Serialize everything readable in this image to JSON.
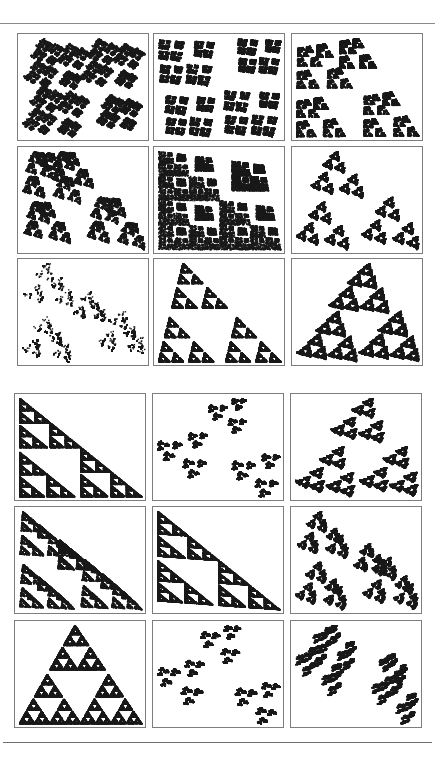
{
  "page": {
    "background": "#ffffff",
    "ink_color": "#1a1a1a",
    "frame_color": "#7d7d7d",
    "rule_color": "#8a8a8a"
  },
  "figure_blocks": [
    {
      "name": "block-top",
      "columns_x": [
        17,
        153,
        291
      ],
      "rows_y": [
        33,
        146,
        258
      ],
      "panel_w": 132,
      "panel_h": 108,
      "panels": [
        {
          "style": "tri-cross",
          "maps": [
            [
              0.5,
              0,
              0,
              0.5,
              0,
              0
            ],
            [
              0.5,
              0,
              0,
              0.5,
              0.5,
              0
            ],
            [
              0.5,
              0,
              0,
              0.5,
              0,
              0.5
            ],
            [
              0.35,
              0,
              0,
              0.35,
              0.6,
              0.6
            ]
          ],
          "rot": 0.35
        },
        {
          "style": "plus-branch",
          "maps": [
            [
              0.45,
              0,
              0,
              0.45,
              0,
              0.05
            ],
            [
              0.45,
              0,
              0,
              0.45,
              0.5,
              0.5
            ],
            [
              0.4,
              0,
              0,
              0.4,
              0.05,
              0.55
            ],
            [
              0.35,
              0,
              0,
              0.35,
              0.6,
              0.05
            ]
          ],
          "rot": 0.1
        },
        {
          "style": "square-loop",
          "maps": [
            [
              0.45,
              0,
              0,
              0.45,
              0.05,
              0.05
            ],
            [
              0.45,
              0,
              0,
              0.45,
              0.5,
              0.5
            ],
            [
              0.4,
              0,
              0,
              0.4,
              0.05,
              0.55
            ],
            [
              0.3,
              0,
              0,
              0.3,
              0.35,
              0.0
            ]
          ],
          "rot": 0.0
        },
        {
          "style": "tri-cross",
          "maps": [
            [
              0.5,
              0,
              0,
              0.5,
              0,
              0
            ],
            [
              0.5,
              0,
              0,
              0.5,
              0.5,
              0.5
            ],
            [
              0.4,
              0,
              0,
              0.4,
              0,
              0.55
            ],
            [
              0.35,
              0,
              0,
              0.35,
              0.2,
              0.0
            ]
          ],
          "rot": 0.2
        },
        {
          "style": "plus-lattice",
          "maps": [
            [
              0.5,
              0,
              0,
              0.5,
              0,
              0
            ],
            [
              0.5,
              0,
              0,
              0.5,
              0.5,
              0.5
            ],
            [
              0.5,
              0,
              0,
              0.5,
              0,
              0.5
            ],
            [
              0.3,
              0,
              0,
              0.3,
              0.6,
              0.1
            ]
          ],
          "rot": 0.0
        },
        {
          "style": "star-cluster",
          "maps": [
            [
              0.45,
              0,
              0,
              0.45,
              0.1,
              0
            ],
            [
              0.5,
              0,
              0,
              0.5,
              0.5,
              0.45
            ],
            [
              0.45,
              0,
              0,
              0.45,
              0,
              0.5
            ]
          ],
          "rot": 0.3
        },
        {
          "style": "hex-ring",
          "maps": [
            [
              0.45,
              0,
              0,
              0.45,
              0,
              0
            ],
            [
              0.45,
              0,
              0,
              0.45,
              0.55,
              0.5
            ],
            [
              0.45,
              0,
              0,
              0.45,
              0,
              0.55
            ],
            [
              0.3,
              0,
              0,
              0.3,
              0.3,
              0.3
            ]
          ],
          "rot": 0.5
        },
        {
          "style": "plus-branch",
          "maps": [
            [
              0.45,
              0,
              0,
              0.45,
              0.1,
              0.0
            ],
            [
              0.45,
              0,
              0,
              0.45,
              0.5,
              0.5
            ],
            [
              0.45,
              0,
              0,
              0.45,
              0.0,
              0.5
            ]
          ],
          "rot": 0.0
        },
        {
          "style": "triangle-gasket",
          "maps": [
            [
              0.5,
              0,
              0,
              0.5,
              0.25,
              0
            ],
            [
              0.5,
              0,
              0,
              0.5,
              0,
              0.5
            ],
            [
              0.5,
              0,
              0,
              0.5,
              0.5,
              0.5
            ]
          ],
          "rot": 0.15
        }
      ]
    },
    {
      "name": "block-bottom",
      "columns_x": [
        14,
        152,
        290
      ],
      "rows_y": [
        393,
        506,
        620
      ],
      "panel_w": 132,
      "panel_h": 108,
      "panels": [
        {
          "style": "hook-steps",
          "maps": [
            [
              0.5,
              0,
              0,
              0.5,
              0,
              0
            ],
            [
              0.5,
              0,
              0,
              0.5,
              0.5,
              0.5
            ],
            [
              0.45,
              0,
              0,
              0.45,
              0,
              0.55
            ]
          ],
          "rot": 0.0
        },
        {
          "style": "hook-diagonal",
          "maps": [
            [
              0.5,
              0,
              0,
              0.5,
              0,
              0.3
            ],
            [
              0.5,
              0,
              0,
              0.5,
              0.5,
              0.5
            ],
            [
              0.4,
              0,
              0,
              0.4,
              0.3,
              0
            ]
          ],
          "rot": 0.6
        },
        {
          "style": "hook-tri",
          "maps": [
            [
              0.45,
              0,
              0,
              0.45,
              0.25,
              0
            ],
            [
              0.5,
              0,
              0,
              0.5,
              0,
              0.5
            ],
            [
              0.5,
              0,
              0,
              0.5,
              0.5,
              0.5
            ]
          ],
          "rot": 0.3
        },
        {
          "style": "hook-steps",
          "maps": [
            [
              0.45,
              0,
              0,
              0.45,
              0,
              0
            ],
            [
              0.5,
              0,
              0,
              0.5,
              0.5,
              0.5
            ],
            [
              0.45,
              0,
              0,
              0.45,
              0,
              0.55
            ],
            [
              0.3,
              0,
              0,
              0.3,
              0.3,
              0.3
            ]
          ],
          "rot": 0.05
        },
        {
          "style": "hook-spine",
          "maps": [
            [
              0.5,
              0,
              0,
              0.5,
              0,
              0
            ],
            [
              0.5,
              0,
              0,
              0.5,
              0.5,
              0.5
            ],
            [
              0.45,
              0,
              0,
              0.45,
              0,
              0.5
            ]
          ],
          "rot": 0.0
        },
        {
          "style": "hook-tri",
          "maps": [
            [
              0.45,
              0,
              0,
              0.45,
              0,
              0
            ],
            [
              0.5,
              0,
              0,
              0.5,
              0.5,
              0.5
            ],
            [
              0.45,
              0,
              0,
              0.45,
              0,
              0.55
            ],
            [
              0.3,
              0,
              0,
              0.3,
              0.35,
              0.35
            ]
          ],
          "rot": 0.4
        },
        {
          "style": "comb-lattice",
          "maps": [
            [
              0.5,
              0,
              0,
              0.5,
              0,
              0.5
            ],
            [
              0.5,
              0,
              0,
              0.5,
              0.5,
              0.5
            ],
            [
              0.45,
              0,
              0,
              0.45,
              0.25,
              0.0
            ]
          ],
          "rot": 0.0
        },
        {
          "style": "hook-swirl",
          "maps": [
            [
              0.5,
              0,
              0,
              0.5,
              0,
              0.3
            ],
            [
              0.5,
              0,
              0,
              0.5,
              0.5,
              0.5
            ],
            [
              0.45,
              0,
              0,
              0.45,
              0.25,
              0
            ]
          ],
          "rot": 0.7
        },
        {
          "style": "dense-cross",
          "maps": [
            [
              0.5,
              0,
              0,
              0.5,
              0,
              0.2
            ],
            [
              0.5,
              0,
              0,
              0.5,
              0.5,
              0.5
            ],
            [
              0.45,
              0,
              0,
              0.45,
              0.1,
              0.0
            ],
            [
              0.3,
              0,
              0,
              0.3,
              0.5,
              0.3
            ]
          ],
          "rot": 0.5
        }
      ]
    }
  ]
}
